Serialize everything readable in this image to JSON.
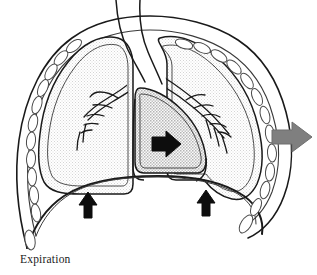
{
  "figure": {
    "title": "Expiration",
    "caption": "Expiration"
  },
  "colors": {
    "background": "#ffffff",
    "outline": "#1a1a1a",
    "lung_fill": "#f3f3f3",
    "heart_fill": "#d9d9d9",
    "rib_fill": "#ffffff",
    "rib_outline": "#555555",
    "black_arrow": "#0d0d0d",
    "gray_arrow": "#7f7f7f",
    "caption_text": "#1a1a1a"
  },
  "structures": {
    "trachea": {
      "label": "trachea"
    },
    "left_lung": {
      "label": "left lung"
    },
    "right_lung": {
      "label": "right lung"
    },
    "left_bronchial_tree": {
      "label": "left bronchial tree"
    },
    "right_bronchial_tree": {
      "label": "right bronchial tree"
    },
    "heart": {
      "label": "heart"
    },
    "diaphragm": {
      "label": "diaphragm"
    },
    "chest_wall": {
      "label": "chest wall"
    },
    "left_ribs": {
      "label": "left ribs"
    },
    "right_ribs": {
      "label": "right ribs"
    },
    "pleura": {
      "label": "pleural membrane"
    }
  },
  "arrows": [
    {
      "id": "heart-arrow",
      "label": "heart recoil arrow",
      "direction": "right",
      "color": "#0d0d0d",
      "x": 160,
      "y": 144
    },
    {
      "id": "chest-wall-arrow",
      "label": "chest wall outward arrow",
      "direction": "right",
      "color": "#7f7f7f",
      "x": 292,
      "y": 137
    },
    {
      "id": "diaphragm-arrow-left",
      "label": "diaphragm upward arrow left",
      "direction": "up",
      "color": "#0d0d0d",
      "x": 88,
      "y": 205
    },
    {
      "id": "diaphragm-arrow-right",
      "label": "diaphragm upward arrow right",
      "direction": "up",
      "color": "#0d0d0d",
      "x": 206,
      "y": 203
    }
  ]
}
